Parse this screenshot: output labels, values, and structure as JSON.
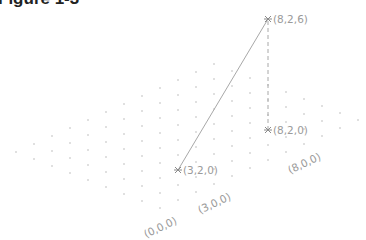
{
  "title": "Figure 1-3",
  "projection": {
    "origin_px": [
      160,
      208
    ],
    "x_unit_px": [
      18,
      -8
    ],
    "y_unit_px": [
      -18,
      -7
    ],
    "z_unit_px": [
      0,
      -18.5
    ],
    "grid_x_max": 11,
    "grid_y_max": 8
  },
  "colors": {
    "dots": "#b8b8b8",
    "line": "#a8a8a8",
    "dashed": "#a8a8a8",
    "labels": "#9a9a9a",
    "markers": "#8a8a8a"
  },
  "points": [
    {
      "id": "p1",
      "coords": [
        3,
        2,
        0
      ],
      "label": "(3,2,0)"
    },
    {
      "id": "p2",
      "coords": [
        8,
        2,
        6
      ],
      "label": "(8,2,6)"
    },
    {
      "id": "p3",
      "coords": [
        8,
        2,
        0
      ],
      "label": "(8,2,0)"
    }
  ],
  "segments": [
    {
      "from": "p1",
      "to": "p2",
      "style": "solid"
    },
    {
      "from": "p3",
      "to": "p2",
      "style": "dashed"
    }
  ],
  "axis_labels": [
    {
      "coords": [
        0,
        0,
        0
      ],
      "label": "(0,0,0)"
    },
    {
      "coords": [
        3,
        0,
        0
      ],
      "label": "(3,0,0)"
    },
    {
      "coords": [
        8,
        0,
        0
      ],
      "label": "(8,0,0)"
    }
  ]
}
